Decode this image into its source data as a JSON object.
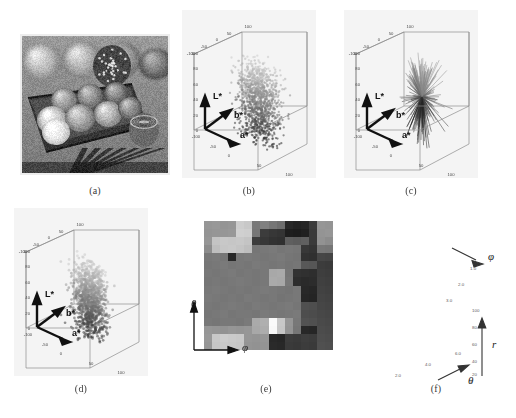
{
  "figure": {
    "panels": [
      {
        "id": "a",
        "caption": "(a)",
        "kind": "photograph",
        "description": "grayscale photo of yarn balls in a wooden box"
      },
      {
        "id": "b",
        "caption": "(b)",
        "kind": "3d-scatter"
      },
      {
        "id": "c",
        "caption": "(c)",
        "kind": "3d-scatter"
      },
      {
        "id": "d",
        "caption": "(d)",
        "kind": "3d-scatter"
      },
      {
        "id": "e",
        "caption": "(e)",
        "kind": "image"
      },
      {
        "id": "f",
        "caption": "(f)",
        "kind": "3d-surface"
      }
    ]
  },
  "lab_axes": {
    "axis_names": {
      "l": "L*",
      "a": "a*",
      "b": "b*"
    },
    "l_ticks": [
      "100",
      "80",
      "60",
      "40",
      "20",
      "0"
    ],
    "a_ticks": [
      "-100",
      "-50",
      "0",
      "50",
      "100"
    ],
    "b_ticks": [
      "-100",
      "-50",
      "0",
      "50",
      "100"
    ],
    "top_ticks": [
      "-100",
      "-50",
      "0",
      "50",
      "100"
    ]
  },
  "panel_e": {
    "x_axis_label": "φ",
    "y_axis_label": "θ"
  },
  "panel_f": {
    "vertical_axis_label": "r",
    "right_axis_label": "φ",
    "front_axis_label": "θ",
    "r_ticks": [
      "100",
      "80",
      "60",
      "40",
      "20",
      "0"
    ],
    "phi_ticks": [
      "1.0",
      "2.0",
      "3.0"
    ],
    "theta_ticks": [
      "2.0",
      "4.0",
      "6.0"
    ]
  },
  "chart_data": [
    {
      "type": "scatter",
      "panel": "b",
      "title": "",
      "xlabel": "a*",
      "ylabel": "b*",
      "zlabel": "L*",
      "xlim": [
        -100,
        100
      ],
      "ylim": [
        -100,
        100
      ],
      "zlim": [
        0,
        100
      ],
      "grid": true,
      "description": "dense CIELAB colour gamut cloud of the yarn image, a vertically elongated blob centred near a*=20, b*=10 spanning L* 20 to 95",
      "cloud": {
        "cx": 20,
        "cy": 10,
        "cz": 55,
        "spread_a": 26,
        "spread_b": 22,
        "spread_l": 34,
        "n_points": 1400
      }
    },
    {
      "type": "scatter",
      "panel": "c",
      "xlabel": "a*",
      "ylabel": "b*",
      "zlabel": "L*",
      "xlim": [
        -100,
        100
      ],
      "ylim": [
        -100,
        100
      ],
      "zlim": [
        0,
        100
      ],
      "grid": true,
      "description": "spiky radial needle cluster: line segments radiating from a common centroid, denser and sharper than (b)",
      "cloud": {
        "cx": 22,
        "cy": 12,
        "cz": 58,
        "spread_a": 24,
        "spread_b": 20,
        "spread_l": 32,
        "n_spikes": 260
      }
    },
    {
      "type": "scatter",
      "panel": "d",
      "xlabel": "a*",
      "ylabel": "b*",
      "zlabel": "L*",
      "xlim": [
        -100,
        100
      ],
      "ylim": [
        -100,
        100
      ],
      "zlim": [
        0,
        100
      ],
      "grid": true,
      "description": "smoothed / quantised version of the (b) gamut cloud, compact solid blob",
      "cloud": {
        "cx": 18,
        "cy": 8,
        "cz": 52,
        "spread_a": 22,
        "spread_b": 18,
        "spread_l": 28,
        "n_points": 1100
      }
    },
    {
      "type": "heatmap",
      "panel": "e",
      "xlabel": "φ",
      "ylabel": "θ",
      "rows": 16,
      "cols": 16,
      "colormap": "grayscale",
      "vmin": 0,
      "vmax": 255,
      "values": [
        [
          150,
          152,
          148,
          150,
          205,
          200,
          120,
          128,
          118,
          110,
          40,
          35,
          38,
          60,
          150,
          148
        ],
        [
          148,
          150,
          150,
          152,
          208,
          206,
          118,
          60,
          55,
          52,
          30,
          28,
          32,
          58,
          148,
          150
        ],
        [
          150,
          196,
          200,
          198,
          200,
          196,
          60,
          55,
          50,
          48,
          95,
          92,
          96,
          58,
          146,
          140
        ],
        [
          140,
          190,
          198,
          200,
          196,
          190,
          118,
          120,
          122,
          118,
          120,
          118,
          56,
          52,
          120,
          118
        ],
        [
          120,
          122,
          118,
          40,
          120,
          122,
          120,
          118,
          120,
          122,
          118,
          116,
          50,
          48,
          70,
          68
        ],
        [
          118,
          120,
          122,
          118,
          120,
          118,
          122,
          120,
          118,
          120,
          116,
          118,
          88,
          86,
          60,
          58
        ],
        [
          120,
          118,
          120,
          122,
          118,
          120,
          118,
          120,
          168,
          170,
          118,
          50,
          48,
          46,
          62,
          60
        ],
        [
          118,
          120,
          118,
          120,
          122,
          120,
          118,
          120,
          170,
          168,
          120,
          45,
          42,
          44,
          64,
          62
        ],
        [
          120,
          122,
          120,
          118,
          120,
          118,
          120,
          122,
          120,
          118,
          116,
          120,
          40,
          38,
          66,
          64
        ],
        [
          122,
          120,
          118,
          120,
          118,
          122,
          120,
          118,
          120,
          116,
          118,
          120,
          38,
          36,
          68,
          66
        ],
        [
          120,
          118,
          120,
          122,
          120,
          118,
          122,
          120,
          118,
          120,
          122,
          118,
          80,
          78,
          70,
          68
        ],
        [
          118,
          120,
          122,
          118,
          120,
          120,
          118,
          122,
          120,
          118,
          120,
          122,
          78,
          76,
          72,
          70
        ],
        [
          120,
          118,
          120,
          120,
          118,
          122,
          170,
          175,
          250,
          200,
          150,
          120,
          82,
          80,
          74,
          72
        ],
        [
          150,
          148,
          146,
          150,
          148,
          150,
          168,
          172,
          248,
          198,
          148,
          118,
          40,
          38,
          76,
          74
        ],
        [
          152,
          200,
          205,
          202,
          200,
          150,
          148,
          150,
          40,
          38,
          60,
          58,
          62,
          60,
          78,
          76
        ],
        [
          150,
          198,
          202,
          200,
          198,
          148,
          146,
          148,
          42,
          40,
          58,
          56,
          60,
          58,
          80,
          78
        ]
      ]
    },
    {
      "type": "area",
      "panel": "f",
      "xlabel": "θ",
      "ylabel": "φ",
      "zlabel": "r",
      "zlim": [
        0,
        100
      ],
      "xlim": [
        0,
        6.0
      ],
      "ylim": [
        0,
        3.0
      ],
      "grid": true,
      "description": "3D wireframe mesh surface of radius r over the (theta, phi) direction sphere; rough multi-peaked terrain with grey faceted faces",
      "mesh_rows": 16,
      "mesh_cols": 16
    }
  ]
}
